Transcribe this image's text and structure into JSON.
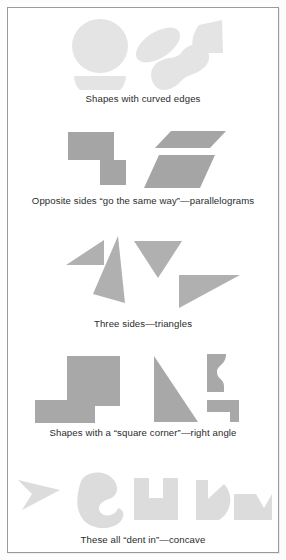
{
  "figure": {
    "background_color": "#ffffff",
    "frame_color": "#9a9a9a",
    "shape_fill_light": "#e2e2e2",
    "shape_fill_mid": "#cfcfcf",
    "shape_fill_dark": "#a3a3a3",
    "caption_color": "#2b2b2b"
  },
  "sections": [
    {
      "id": "curved-edges",
      "caption": "Shapes with curved edges",
      "shape_names": [
        "circle",
        "ellipse",
        "quarter-round",
        "half-disc",
        "curved-bean"
      ],
      "fill": "#e4e4e4"
    },
    {
      "id": "parallelograms",
      "caption": "Opposite sides “go the same way”—parallelograms",
      "shape_names": [
        "rectangle",
        "square",
        "parallelogram-wide",
        "parallelogram-slanted"
      ],
      "fill": "#a5a5a5"
    },
    {
      "id": "triangles",
      "caption": "Three sides—triangles",
      "shape_names": [
        "small-right-triangle",
        "tall-thin-triangle",
        "inverted-triangle",
        "wide-right-triangle"
      ],
      "fill": "#b0b0b0"
    },
    {
      "id": "right-angle",
      "caption": "Shapes with a “square corner”—right angle",
      "shape_names": [
        "square",
        "rectangle",
        "right-triangle",
        "curved-bracket",
        "l-step-shape"
      ],
      "fill": "#a8a8a8"
    },
    {
      "id": "concave",
      "caption": "These all “dent in”—concave",
      "shape_names": [
        "arrowhead-dart",
        "blob-curl",
        "u-block",
        "pac-shape",
        "notched-block"
      ],
      "fill": "#dcdcdc"
    }
  ]
}
